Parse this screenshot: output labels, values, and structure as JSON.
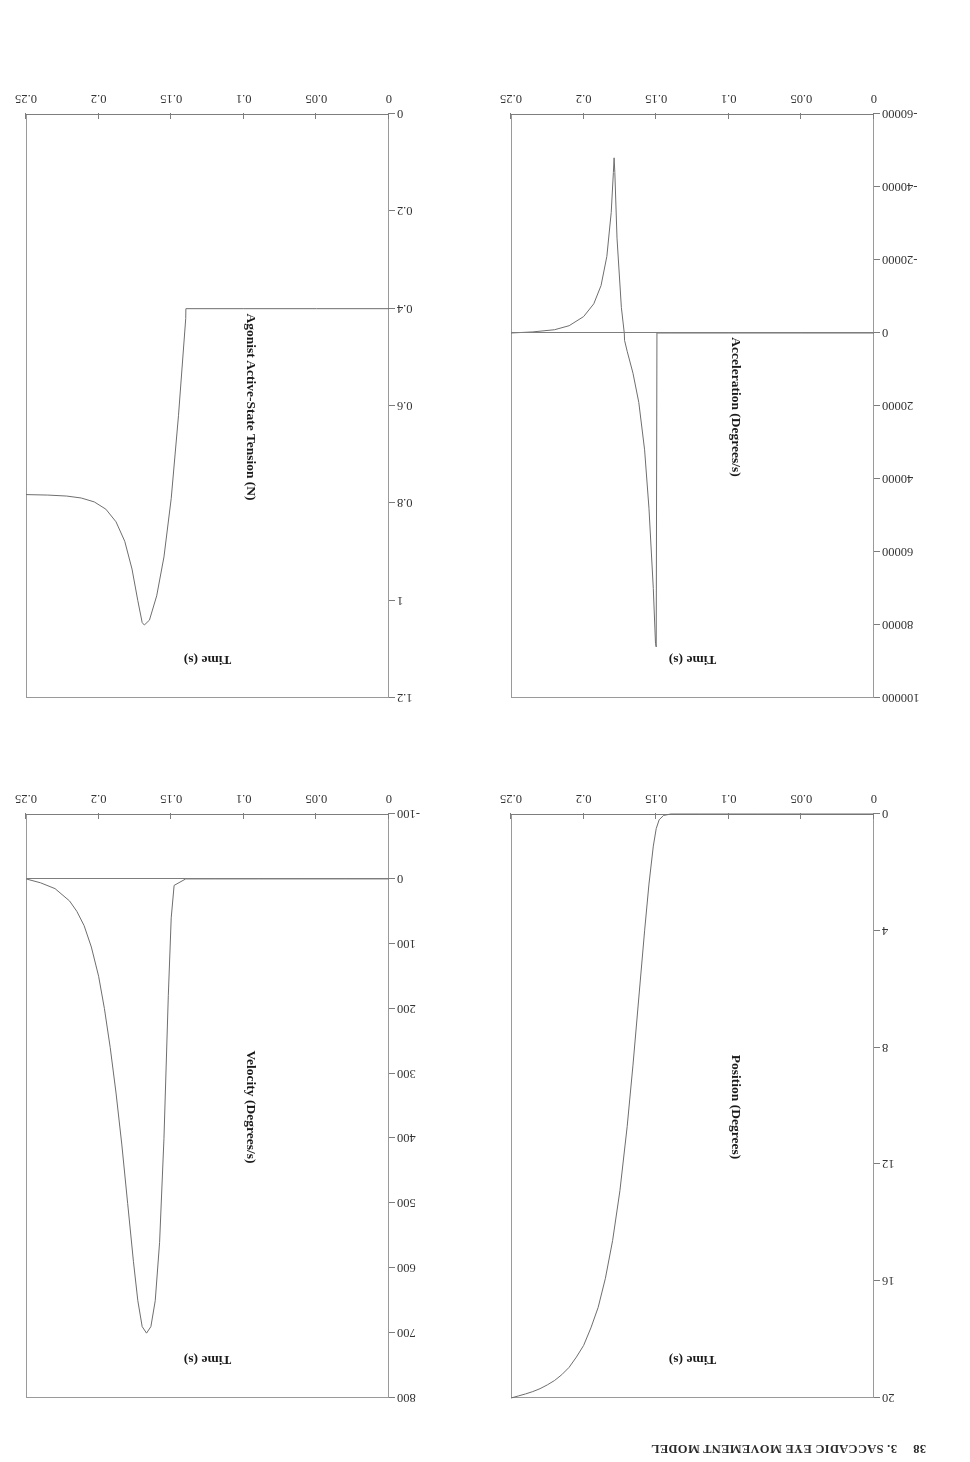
{
  "page": {
    "header_number": "38",
    "header_text": "3. SACCADIC EYE MOVEMENT MODEL"
  },
  "chart_data": [
    {
      "id": "position",
      "type": "line",
      "title": "",
      "xlabel": "Time (s)",
      "ylabel": "Position (Degrees)",
      "xlim": [
        0,
        0.25
      ],
      "ylim": [
        0,
        20
      ],
      "xticks": [
        "0",
        "0.05",
        "0.1",
        "0.15",
        "0.2",
        "0.25"
      ],
      "xtickvals": [
        0,
        0.05,
        0.1,
        0.15,
        0.2,
        0.25
      ],
      "yticks": [
        "0",
        "4",
        "8",
        "12",
        "16",
        "20"
      ],
      "ytickvals": [
        0,
        4,
        8,
        12,
        16,
        20
      ],
      "grid": false,
      "legend": "none",
      "series": [
        {
          "name": "Position",
          "x": [
            0,
            0.02,
            0.04,
            0.06,
            0.08,
            0.1,
            0.12,
            0.14,
            0.145,
            0.148,
            0.15,
            0.152,
            0.155,
            0.158,
            0.162,
            0.166,
            0.17,
            0.175,
            0.18,
            0.185,
            0.19,
            0.195,
            0.2,
            0.205,
            0.21,
            0.215,
            0.22,
            0.225,
            0.23,
            0.235,
            0.24,
            0.245,
            0.25
          ],
          "y": [
            0,
            0,
            0,
            0,
            0,
            0,
            0,
            0,
            0.05,
            0.2,
            0.5,
            1.1,
            2.4,
            4.0,
            6.3,
            8.6,
            10.7,
            12.9,
            14.6,
            15.9,
            16.9,
            17.6,
            18.2,
            18.6,
            18.95,
            19.2,
            19.4,
            19.55,
            19.68,
            19.78,
            19.86,
            19.93,
            20.0
          ]
        }
      ]
    },
    {
      "id": "velocity",
      "type": "line",
      "title": "",
      "xlabel": "Time (s)",
      "ylabel": "Velocity (Degrees/s)",
      "xlim": [
        0,
        0.25
      ],
      "ylim": [
        -100,
        800
      ],
      "xticks": [
        "0",
        "0.05",
        "0.1",
        "0.15",
        "0.2",
        "0.25"
      ],
      "xtickvals": [
        0,
        0.05,
        0.1,
        0.15,
        0.2,
        0.25
      ],
      "yticks": [
        "-100",
        "0",
        "100",
        "200",
        "300",
        "400",
        "500",
        "600",
        "700",
        "800"
      ],
      "ytickvals": [
        -100,
        0,
        100,
        200,
        300,
        400,
        500,
        600,
        700,
        800
      ],
      "grid": false,
      "legend": "none",
      "series": [
        {
          "name": "Velocity",
          "x": [
            0,
            0.03,
            0.06,
            0.09,
            0.12,
            0.14,
            0.148,
            0.15,
            0.152,
            0.155,
            0.158,
            0.161,
            0.164,
            0.167,
            0.17,
            0.173,
            0.176,
            0.18,
            0.184,
            0.188,
            0.192,
            0.196,
            0.2,
            0.205,
            0.21,
            0.215,
            0.22,
            0.23,
            0.24,
            0.25
          ],
          "y": [
            0,
            0,
            0,
            0,
            0,
            0,
            10,
            60,
            180,
            400,
            560,
            650,
            690,
            700,
            690,
            650,
            590,
            500,
            410,
            330,
            260,
            200,
            150,
            105,
            72,
            50,
            34,
            15,
            6,
            0
          ]
        }
      ]
    },
    {
      "id": "acceleration",
      "type": "line",
      "title": "",
      "xlabel": "Time (s)",
      "ylabel": "Acceleration (Degrees/s)",
      "xlim": [
        0,
        0.25
      ],
      "ylim": [
        -60000,
        100000
      ],
      "xticks": [
        "0",
        "0.05",
        "0.1",
        "0.15",
        "0.2",
        "0.25"
      ],
      "xtickvals": [
        0,
        0.05,
        0.1,
        0.15,
        0.2,
        0.25
      ],
      "yticks": [
        "-60000",
        "-40000",
        "-20000",
        "0",
        "20000",
        "40000",
        "60000",
        "80000",
        "100000"
      ],
      "ytickvals": [
        -60000,
        -40000,
        -20000,
        0,
        20000,
        40000,
        60000,
        80000,
        100000
      ],
      "grid": false,
      "legend": "none",
      "series": [
        {
          "name": "Acceleration",
          "x": [
            0,
            0.05,
            0.1,
            0.14,
            0.1495,
            0.15,
            0.1505,
            0.152,
            0.155,
            0.158,
            0.162,
            0.166,
            0.17,
            0.1718,
            0.172,
            0.174,
            0.177,
            0.1785,
            0.179,
            0.1795,
            0.181,
            0.184,
            0.188,
            0.193,
            0.2,
            0.21,
            0.22,
            0.235,
            0.25
          ],
          "y": [
            0,
            0,
            0,
            0,
            0,
            86000,
            85000,
            70000,
            48000,
            32000,
            19000,
            11000,
            5000,
            2000,
            0,
            -7000,
            -26000,
            -44000,
            -48000,
            -44000,
            -33000,
            -21000,
            -13000,
            -8000,
            -4500,
            -2000,
            -900,
            -300,
            0
          ]
        }
      ]
    },
    {
      "id": "agonist_tension",
      "type": "line",
      "title": "",
      "xlabel": "Time (s)",
      "ylabel": "Agonist Active-State Tension (N)",
      "xlim": [
        0,
        0.25
      ],
      "ylim": [
        0,
        1.2
      ],
      "xticks": [
        "0",
        "0.05",
        "0.1",
        "0.15",
        "0.2",
        "0.25"
      ],
      "xtickvals": [
        0,
        0.05,
        0.1,
        0.15,
        0.2,
        0.25
      ],
      "yticks": [
        "0",
        "0.2",
        "0.4",
        "0.6",
        "0.8",
        "1",
        "1.2"
      ],
      "ytickvals": [
        0,
        0.2,
        0.4,
        0.6,
        0.8,
        1,
        1.2
      ],
      "grid": false,
      "legend": "none",
      "series": [
        {
          "name": "Agonist Active-State Tension",
          "x": [
            0,
            0.05,
            0.1,
            0.1399,
            0.14,
            0.145,
            0.15,
            0.155,
            0.16,
            0.165,
            0.1685,
            0.17,
            0.173,
            0.177,
            0.182,
            0.188,
            0.195,
            0.203,
            0.212,
            0.222,
            0.235,
            0.25
          ],
          "y": [
            0.4,
            0.4,
            0.4,
            0.4,
            0.42,
            0.62,
            0.79,
            0.91,
            0.99,
            1.04,
            1.05,
            1.045,
            1.0,
            0.935,
            0.878,
            0.838,
            0.812,
            0.797,
            0.789,
            0.785,
            0.783,
            0.782
          ]
        }
      ]
    }
  ]
}
